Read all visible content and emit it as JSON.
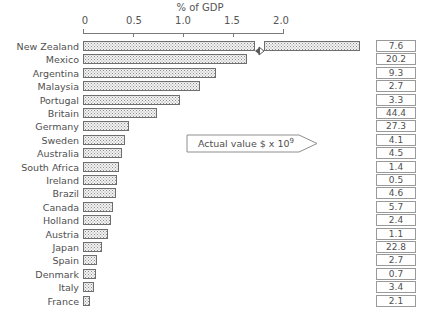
{
  "chart_data": {
    "type": "bar",
    "orientation": "horizontal",
    "title": "",
    "xlabel": "% of GDP",
    "ylabel": "",
    "xlim": [
      0,
      2.0
    ],
    "xticks": [
      "0",
      "0.5",
      "1.0",
      "1.5",
      "2.0"
    ],
    "xtick_values": [
      0,
      0.5,
      1.0,
      1.5,
      2.0
    ],
    "grid": false,
    "legend": false,
    "axis_break": true,
    "axis_break_note": "New Zealand bar is broken and extends past the 2.0 axis limit",
    "categories": [
      "New Zealand",
      "Mexico",
      "Argentina",
      "Malaysia",
      "Portugal",
      "Britain",
      "Germany",
      "Sweden",
      "Australia",
      "South Africa",
      "Ireland",
      "Brazil",
      "Canada",
      "Holland",
      "Austria",
      "Japan",
      "Spain",
      "Denmark",
      "Italy",
      "France"
    ],
    "values": [
      2.8,
      1.64,
      1.33,
      1.17,
      0.97,
      0.74,
      0.46,
      0.42,
      0.39,
      0.36,
      0.34,
      0.33,
      0.3,
      0.28,
      0.25,
      0.19,
      0.14,
      0.13,
      0.11,
      0.07
    ],
    "annotation_label": "Actual value $ x 10",
    "annotation_exponent": "9",
    "value_column_label": "Actual value $ x 10^9",
    "actual_values": [
      "7.6",
      "20.2",
      "9.3",
      "2.7",
      "3.3",
      "44.4",
      "27.3",
      "4.1",
      "4.5",
      "1.4",
      "0.5",
      "4.6",
      "5.7",
      "2.4",
      "1.1",
      "22.8",
      "2.7",
      "0.7",
      "3.4",
      "2.1"
    ],
    "colors": {
      "bar_fill": "#f2f2f2",
      "bar_border": "#6e6e6e",
      "axis": "#7a7a7a",
      "text": "#4f4f4f",
      "background": "#ffffff"
    }
  }
}
